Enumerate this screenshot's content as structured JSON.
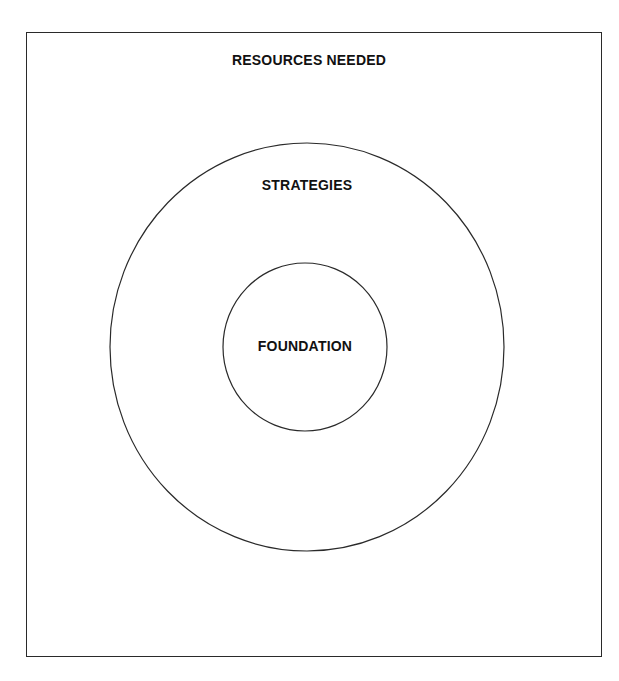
{
  "diagram": {
    "type": "nested-circles-in-box",
    "outer_box": {
      "label": "RESOURCES NEEDED"
    },
    "outer_circle": {
      "label": "STRATEGIES"
    },
    "inner_circle": {
      "label": "FOUNDATION"
    },
    "colors": {
      "stroke": "#2a2a2a",
      "text": "#111111",
      "background": "#ffffff"
    }
  }
}
